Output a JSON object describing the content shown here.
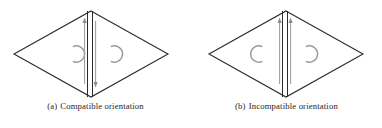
{
  "figure": {
    "background_color": "#ffffff",
    "stroke_color": "#2b2b2b",
    "arc_color": "#8c8c8c",
    "arrow_color": "#8c8c8c",
    "subfigures": [
      {
        "id": "a",
        "tag": "(a)",
        "caption": "Compatible orientation",
        "diagram": {
          "shape": "rhombus",
          "center_line_count": 2,
          "arrows": [
            {
              "name": "left-arrow",
              "direction": "up"
            },
            {
              "name": "right-arrow",
              "direction": "down"
            }
          ],
          "arcs": [
            {
              "name": "left-arc",
              "opening": "right",
              "mirrored": true
            },
            {
              "name": "right-arc",
              "opening": "right",
              "mirrored": true
            }
          ]
        }
      },
      {
        "id": "b",
        "tag": "(b)",
        "caption": "Incompatible orientation",
        "diagram": {
          "shape": "rhombus",
          "center_line_count": 2,
          "arrows": [
            {
              "name": "left-arrow",
              "direction": "up"
            },
            {
              "name": "right-arrow",
              "direction": "up"
            }
          ],
          "arcs": [
            {
              "name": "left-arc",
              "opening": "right",
              "mirrored": false
            },
            {
              "name": "right-arc",
              "opening": "right",
              "mirrored": true
            }
          ]
        }
      }
    ]
  }
}
